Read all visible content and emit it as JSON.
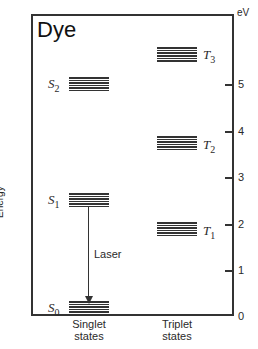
{
  "title": "Dye",
  "y_axis": {
    "label": "Energy",
    "unit": "eV",
    "ticks": [
      "0",
      "1",
      "2",
      "3",
      "4",
      "5"
    ]
  },
  "columns": {
    "singlet": "Singlet\nstates",
    "triplet": "Triplet\nstates"
  },
  "levels": {
    "S0": {
      "name": "S",
      "sub": "0",
      "energy_eV": 0.0
    },
    "S1": {
      "name": "S",
      "sub": "1",
      "energy_eV": 2.5
    },
    "S2": {
      "name": "S",
      "sub": "2",
      "energy_eV": 5.0
    },
    "T1": {
      "name": "T",
      "sub": "1",
      "energy_eV": 1.8
    },
    "T2": {
      "name": "T",
      "sub": "2",
      "energy_eV": 3.7
    },
    "T3": {
      "name": "T",
      "sub": "3",
      "energy_eV": 5.7
    }
  },
  "transition": {
    "label": "Laser",
    "from": "S1",
    "to": "S0"
  }
}
